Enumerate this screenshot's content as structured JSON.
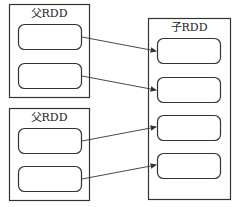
{
  "diagram": {
    "parent_rdd_1": {
      "label": "父RDD",
      "partitions": 2
    },
    "parent_rdd_2": {
      "label": "父RDD",
      "partitions": 2
    },
    "child_rdd": {
      "label": "子RDD",
      "partitions": 4
    },
    "edges": [
      {
        "from": "parent_rdd_1.partition_0",
        "to": "child_rdd.partition_0"
      },
      {
        "from": "parent_rdd_1.partition_1",
        "to": "child_rdd.partition_1"
      },
      {
        "from": "parent_rdd_2.partition_0",
        "to": "child_rdd.partition_2"
      },
      {
        "from": "parent_rdd_2.partition_1",
        "to": "child_rdd.partition_3"
      }
    ],
    "colors": {
      "stroke": "#333333",
      "background": "#ffffff"
    }
  }
}
